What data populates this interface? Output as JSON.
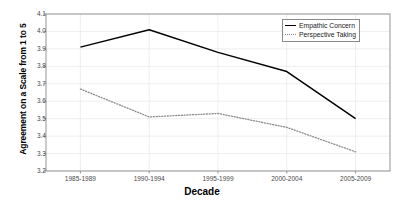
{
  "chart_data": {
    "type": "line",
    "title": "",
    "xlabel": "Decade",
    "ylabel": "Agreement on a Scale from 1 to 5",
    "categories": [
      "1985-1989",
      "1990-1994",
      "1995-1999",
      "2000-2004",
      "2005-2009"
    ],
    "ylim": [
      3.2,
      4.1
    ],
    "yticks": [
      "3.2",
      "3.3",
      "3.4",
      "3.5",
      "3.6",
      "3.7",
      "3.8",
      "3.9",
      "4.0",
      "4.1"
    ],
    "ytick_values": [
      3.2,
      3.3,
      3.4,
      3.5,
      3.6,
      3.7,
      3.8,
      3.9,
      4.0,
      4.1
    ],
    "grid": true,
    "legend_position": "top-right",
    "series": [
      {
        "name": "Empathic Concern",
        "style": "solid",
        "color": "#000000",
        "values": [
          3.91,
          4.01,
          3.88,
          3.77,
          3.5
        ]
      },
      {
        "name": "Perspective Taking",
        "style": "dotted",
        "color": "#8c8c8c",
        "values": [
          3.67,
          3.51,
          3.53,
          3.45,
          3.31
        ]
      }
    ]
  },
  "legend": {
    "items": [
      {
        "label": "Empathic Concern",
        "style": "solid"
      },
      {
        "label": "Perspective Taking",
        "style": "dotted"
      }
    ]
  },
  "axes": {
    "x_title": "Decade",
    "y_title": "Agreement on a Scale from 1 to 5"
  },
  "colors": {
    "series_empathic": "#000000",
    "series_perspective": "#8c8c8c",
    "axis": "#8a8a8a",
    "grid": "#e8e8e8",
    "background": "#ffffff",
    "text": "#1a1a1a"
  }
}
